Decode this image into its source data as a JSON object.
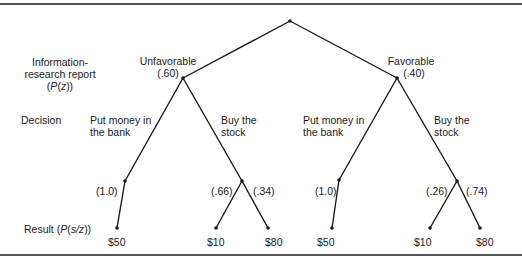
{
  "row_labels": {
    "report_line1": "Information-",
    "report_line2": "research report",
    "report_line3_pre": "(",
    "report_line3_var": "P",
    "report_line3_mid": "(",
    "report_line3_z": "z",
    "report_line3_post": "))",
    "decision": "Decision",
    "result_pre": "Result (",
    "result_var": "P",
    "result_mid": "(",
    "result_sz": "s/z",
    "result_post": "))"
  },
  "branches": {
    "unfavorable": {
      "label": "Unfavorable",
      "prob": "(.60)"
    },
    "favorable": {
      "label": "Favorable",
      "prob": "(.40)"
    }
  },
  "decisions": {
    "left_bank_line1": "Put money in",
    "left_bank_line2": "the bank",
    "left_stock_line1": "Buy the",
    "left_stock_line2": "stock",
    "right_bank_line1": "Put money in",
    "right_bank_line2": "the bank",
    "right_stock_line1": "Buy the",
    "right_stock_line2": "stock"
  },
  "probabilities": {
    "left_bank": "(1.0)",
    "left_stock_low": "(.66)",
    "left_stock_high": "(.34)",
    "right_bank": "(1.0)",
    "right_stock_low": "(.26)",
    "right_stock_high": "(.74)"
  },
  "results": {
    "left_bank": "$50",
    "left_stock_low": "$10",
    "left_stock_high": "$80",
    "right_bank": "$50",
    "right_stock_low": "$10",
    "right_stock_high": "$80"
  },
  "colors": {
    "line": "#1a1a1a",
    "rule": "#555555"
  }
}
